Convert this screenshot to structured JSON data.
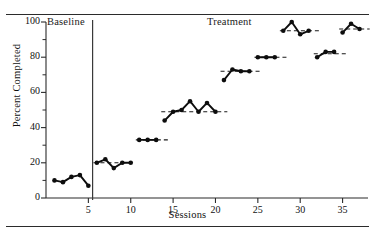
{
  "figure": {
    "type": "single-case-changing-criterion-graph",
    "phase_labels": [
      {
        "name": "baseline",
        "text": "Baseline"
      },
      {
        "name": "treatment",
        "text": "Treatment"
      }
    ]
  },
  "chart_data": {
    "type": "line",
    "title": "",
    "xlabel": "Sessions",
    "ylabel": "Percent Completed",
    "xlim": [
      0,
      38
    ],
    "ylim": [
      0,
      100
    ],
    "xticks": [
      5,
      10,
      15,
      20,
      25,
      30,
      35
    ],
    "yticks": [
      0,
      20,
      40,
      60,
      80,
      100
    ],
    "yminorticks": [
      10,
      30,
      50,
      70,
      90
    ],
    "grid": false,
    "legend": null,
    "phase_change_line_x": 5.5,
    "marker": "filled-circle",
    "series": [
      {
        "name": "Baseline",
        "phase": "baseline",
        "x": [
          1,
          2,
          3,
          4,
          5
        ],
        "values": [
          10,
          9,
          12,
          13,
          7
        ]
      },
      {
        "name": "Treatment Criterion 1",
        "phase": "treatment",
        "criterion": 20,
        "criterion_line": {
          "x_start": 5.6,
          "x_end": 10.4
        },
        "x": [
          6,
          7,
          8,
          9,
          10
        ],
        "values": [
          20,
          22,
          17,
          20,
          20
        ]
      },
      {
        "name": "Treatment Criterion 2",
        "phase": "treatment",
        "criterion": 33,
        "criterion_line": {
          "x_start": 10.6,
          "x_end": 14.4
        },
        "x": [
          11,
          12,
          13
        ],
        "values": [
          33,
          33,
          33
        ]
      },
      {
        "name": "Treatment Criterion 3",
        "phase": "treatment",
        "criterion": 49,
        "criterion_line": {
          "x_start": 13.6,
          "x_end": 21.4
        },
        "x": [
          14,
          15,
          16,
          17,
          18,
          19,
          20
        ],
        "values": [
          44,
          49,
          50,
          55,
          49,
          54,
          49
        ]
      },
      {
        "name": "Treatment Criterion 4",
        "phase": "treatment",
        "criterion": 72,
        "criterion_line": {
          "x_start": 20.6,
          "x_end": 25.4
        },
        "x": [
          21,
          22,
          23,
          24
        ],
        "values": [
          67,
          73,
          72,
          72
        ]
      },
      {
        "name": "Treatment Criterion 5",
        "phase": "treatment",
        "criterion": 80,
        "criterion_line": {
          "x_start": 24.6,
          "x_end": 28.4
        },
        "x": [
          25,
          26,
          27
        ],
        "values": [
          80,
          80,
          80
        ]
      },
      {
        "name": "Treatment Criterion 6",
        "phase": "treatment",
        "criterion": 95,
        "criterion_line": {
          "x_start": 27.6,
          "x_end": 32.4
        },
        "x": [
          28,
          29,
          30,
          31
        ],
        "values": [
          95,
          100,
          93,
          95
        ]
      },
      {
        "name": "Treatment Criterion 7",
        "phase": "treatment",
        "criterion": 82,
        "criterion_line": {
          "x_start": 31.6,
          "x_end": 35.4
        },
        "x": [
          32,
          33,
          34
        ],
        "values": [
          80,
          83,
          83
        ]
      },
      {
        "name": "Treatment Criterion 8",
        "phase": "treatment",
        "criterion": 96,
        "criterion_line": {
          "x_start": 34.6,
          "x_end": 38.2
        },
        "x": [
          35,
          36,
          37
        ],
        "values": [
          94,
          99,
          96
        ]
      }
    ]
  }
}
